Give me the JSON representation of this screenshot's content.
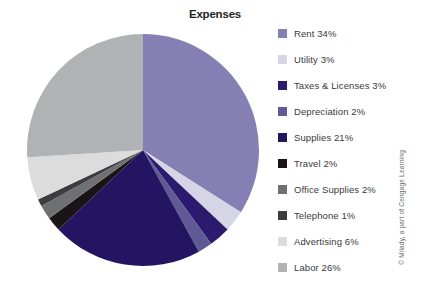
{
  "chart_data": {
    "type": "pie",
    "title": "Expenses",
    "xlabel": "",
    "ylabel": "",
    "legend_position": "right",
    "start_angle_deg": 0,
    "direction": "clockwise",
    "categories": [
      "Rent",
      "Utility",
      "Taxes & Licenses",
      "Depreciation",
      "Supplies",
      "Travel",
      "Office Supplies",
      "Telephone",
      "Advertising",
      "Labor"
    ],
    "values": [
      34,
      3,
      3,
      2,
      21,
      2,
      2,
      1,
      6,
      26
    ],
    "value_unit": "%",
    "colors": [
      "#8480b4",
      "#d6d5e6",
      "#2b1a6e",
      "#5f5a93",
      "#241563",
      "#1a1416",
      "#6f7072",
      "#3c3c3e",
      "#dcdcdc",
      "#b0b2b4"
    ],
    "slices": [
      {
        "label": "Rent",
        "value": 34,
        "display": "34%",
        "color": "#8480b4"
      },
      {
        "label": "Utility",
        "value": 3,
        "display": "3%",
        "color": "#d6d5e6"
      },
      {
        "label": "Taxes & Licenses",
        "value": 3,
        "display": "3%",
        "color": "#2b1a6e"
      },
      {
        "label": "Depreciation",
        "value": 2,
        "display": "2%",
        "color": "#5f5a93"
      },
      {
        "label": "Supplies",
        "value": 21,
        "display": "21%",
        "color": "#241563"
      },
      {
        "label": "Travel",
        "value": 2,
        "display": "2%",
        "color": "#1a1416"
      },
      {
        "label": "Office Supplies",
        "value": 2,
        "display": "2%",
        "color": "#6f7072"
      },
      {
        "label": "Telephone",
        "value": 1,
        "display": "1%",
        "color": "#3c3c3e"
      },
      {
        "label": "Advertising",
        "value": 6,
        "display": "6%",
        "color": "#dcdcdc"
      },
      {
        "label": "Labor",
        "value": 26,
        "display": "26%",
        "color": "#b0b2b4"
      }
    ]
  },
  "legend": {
    "items": [
      {
        "label": "Rent  34%",
        "color": "#8480b4",
        "name": "legend-item-rent"
      },
      {
        "label": "Utility 3%",
        "color": "#d6d5e6",
        "name": "legend-item-utility"
      },
      {
        "label": "Taxes & Licenses 3%",
        "color": "#2b1a6e",
        "name": "legend-item-taxes-licenses"
      },
      {
        "label": "Depreciation 2%",
        "color": "#5f5a93",
        "name": "legend-item-depreciation"
      },
      {
        "label": "Supplies 21%",
        "color": "#241563",
        "name": "legend-item-supplies"
      },
      {
        "label": "Travel  2%",
        "color": "#1a1416",
        "name": "legend-item-travel"
      },
      {
        "label": "Office Supplies 2%",
        "color": "#6f7072",
        "name": "legend-item-office-supplies"
      },
      {
        "label": "Telephone 1%",
        "color": "#3c3c3e",
        "name": "legend-item-telephone"
      },
      {
        "label": "Advertising 6%",
        "color": "#dcdcdc",
        "name": "legend-item-advertising"
      },
      {
        "label": "Labor  26%",
        "color": "#b0b2b4",
        "name": "legend-item-labor"
      }
    ]
  },
  "credit": {
    "text": "© Milady, a part of Cengage Learning"
  }
}
